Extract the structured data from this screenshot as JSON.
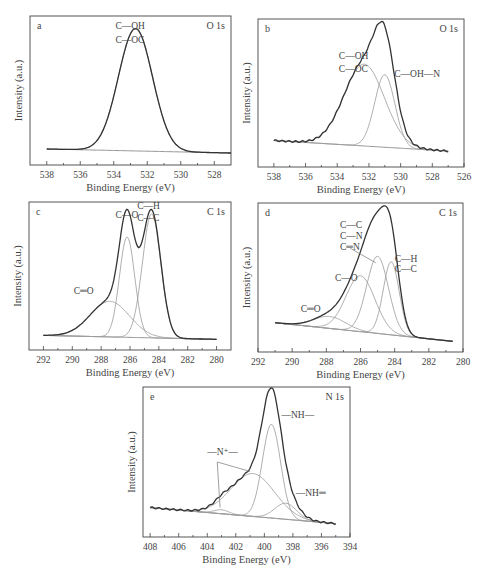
{
  "figure": {
    "panels": [
      {
        "id": "a",
        "core": "O 1s"
      },
      {
        "id": "b",
        "core": "O 1s"
      },
      {
        "id": "c",
        "core": "C 1s"
      },
      {
        "id": "d",
        "core": "C 1s"
      },
      {
        "id": "e",
        "core": "N 1s"
      }
    ]
  },
  "chart_data": [
    {
      "type": "line",
      "panel": "a",
      "title": "O 1s",
      "xlabel": "Binding Energy (eV)",
      "ylabel": "Intensity (a.u.)",
      "xlim": [
        539,
        527
      ],
      "xticks": [
        538,
        536,
        534,
        532,
        530,
        528
      ],
      "frame": {
        "x": 30,
        "y": 16,
        "w": 201,
        "h": 149
      },
      "data_x_range": [
        538,
        527
      ],
      "baseline": [
        [
          538,
          0.06
        ],
        [
          527,
          0.03
        ]
      ],
      "peaks": [
        {
          "label": "C—OH / C—OC",
          "center": 532.7,
          "fwhm": 2.4,
          "height": 0.92
        }
      ],
      "annotations": [
        {
          "text": "C—OH",
          "x": 533.9,
          "y": 0.96
        },
        {
          "text": "C—OC",
          "x": 533.9,
          "y": 0.86
        }
      ],
      "leaders": []
    },
    {
      "type": "line",
      "panel": "b",
      "title": "O 1s",
      "xlabel": "Binding Energy (eV)",
      "ylabel": "Intensity (a.u.)",
      "xlim": [
        539,
        526
      ],
      "xticks": [
        538,
        536,
        534,
        532,
        530,
        528,
        526
      ],
      "frame": {
        "x": 258,
        "y": 19,
        "w": 206,
        "h": 148
      },
      "data_x_range": [
        538,
        527
      ],
      "baseline": [
        [
          538,
          0.14
        ],
        [
          527,
          0.06
        ]
      ],
      "peaks": [
        {
          "label": "C—OH / C—OC",
          "center": 532.3,
          "fwhm": 3.0,
          "height": 0.62
        },
        {
          "label": "C—OH—N",
          "center": 531.0,
          "fwhm": 1.5,
          "height": 0.55
        }
      ],
      "annotations": [
        {
          "text": "C—OH",
          "x": 533.9,
          "y": 0.76
        },
        {
          "text": "C—OC",
          "x": 533.9,
          "y": 0.66
        },
        {
          "text": "C—OH—N",
          "x": 530.4,
          "y": 0.62
        }
      ],
      "leaders": []
    },
    {
      "type": "line",
      "panel": "c",
      "title": "C 1s",
      "xlabel": "Binding Energy (eV)",
      "ylabel": "Intensity (a.u.)",
      "xlim": [
        293,
        279
      ],
      "xticks": [
        292,
        290,
        288,
        286,
        284,
        282,
        280
      ],
      "frame": {
        "x": 29,
        "y": 202,
        "w": 202,
        "h": 148
      },
      "data_x_range": [
        292,
        280
      ],
      "baseline": [
        [
          292,
          0.05
        ],
        [
          280,
          0.02
        ]
      ],
      "peaks": [
        {
          "label": "C=O",
          "center": 287.4,
          "fwhm": 3.2,
          "height": 0.27
        },
        {
          "label": "C—O",
          "center": 286.2,
          "fwhm": 1.25,
          "height": 0.76
        },
        {
          "label": "C—H / C—C",
          "center": 284.5,
          "fwhm": 1.5,
          "height": 0.94
        }
      ],
      "annotations": [
        {
          "text": "C—O",
          "x": 287.0,
          "y": 0.94
        },
        {
          "text": "C—H",
          "x": 285.5,
          "y": 1.01
        },
        {
          "text": "C—C",
          "x": 285.5,
          "y": 0.92
        },
        {
          "text": "C═O",
          "x": 289.9,
          "y": 0.36
        }
      ],
      "leaders": []
    },
    {
      "type": "line",
      "panel": "d",
      "title": "C 1s",
      "xlabel": "Binding Energy (eV)",
      "ylabel": "Intensity (a.u.)",
      "xlim": [
        292,
        280
      ],
      "xticks": [
        292,
        290,
        288,
        286,
        284,
        282,
        280
      ],
      "frame": {
        "x": 258,
        "y": 203,
        "w": 205,
        "h": 149
      },
      "data_x_range": [
        291,
        280.6
      ],
      "baseline": [
        [
          291,
          0.16
        ],
        [
          280.6,
          0.02
        ]
      ],
      "peaks": [
        {
          "label": "C=O",
          "center": 287.8,
          "fwhm": 2.2,
          "height": 0.09
        },
        {
          "label": "C—O",
          "center": 286.0,
          "fwhm": 2.0,
          "height": 0.42
        },
        {
          "label": "C—C / C—N / C=N",
          "center": 285.0,
          "fwhm": 1.5,
          "height": 0.58
        },
        {
          "label": "C—H / C—C",
          "center": 284.2,
          "fwhm": 1.1,
          "height": 0.55
        }
      ],
      "annotations": [
        {
          "text": "C—C",
          "x": 287.2,
          "y": 0.87
        },
        {
          "text": "C—N",
          "x": 287.2,
          "y": 0.79
        },
        {
          "text": "C═N",
          "x": 287.2,
          "y": 0.71
        },
        {
          "text": "C—H",
          "x": 284.0,
          "y": 0.62
        },
        {
          "text": "C—C",
          "x": 284.0,
          "y": 0.54
        },
        {
          "text": "C—O",
          "x": 287.5,
          "y": 0.47
        },
        {
          "text": "C═O",
          "x": 289.5,
          "y": 0.24
        }
      ],
      "leaders": [
        [
          [
            286.6,
            0.72
          ],
          [
            285.1,
            0.61
          ]
        ]
      ]
    },
    {
      "type": "line",
      "panel": "e",
      "title": "N 1s",
      "xlabel": "Binding Energy (eV)",
      "ylabel": "Intensity (a.u.)",
      "xlim": [
        408.5,
        394
      ],
      "xticks": [
        408,
        406,
        404,
        402,
        400,
        398,
        396,
        394
      ],
      "frame": {
        "x": 143,
        "y": 387,
        "w": 207,
        "h": 150
      },
      "data_x_range": [
        408,
        395
      ],
      "baseline": [
        [
          408,
          0.16
        ],
        [
          395,
          0.04
        ]
      ],
      "peaks": [
        {
          "label": "—N⁺—",
          "center": 403.0,
          "fwhm": 1.2,
          "height": 0.03
        },
        {
          "label": "—N⁺—",
          "center": 400.8,
          "fwhm": 3.6,
          "height": 0.32
        },
        {
          "label": "—NH—",
          "center": 399.5,
          "fwhm": 1.5,
          "height": 0.7
        },
        {
          "label": "—NH=",
          "center": 398.5,
          "fwhm": 1.8,
          "height": 0.12
        }
      ],
      "annotations": [
        {
          "text": "—NH—",
          "x": 398.8,
          "y": 0.83
        },
        {
          "text": "—N⁺—",
          "x": 404.0,
          "y": 0.55
        },
        {
          "text": "—NH═",
          "x": 397.8,
          "y": 0.25
        }
      ],
      "leaders": [
        [
          [
            403.3,
            0.5
          ],
          [
            403.1,
            0.16
          ]
        ],
        [
          [
            403.3,
            0.5
          ],
          [
            401.0,
            0.43
          ]
        ]
      ]
    }
  ]
}
